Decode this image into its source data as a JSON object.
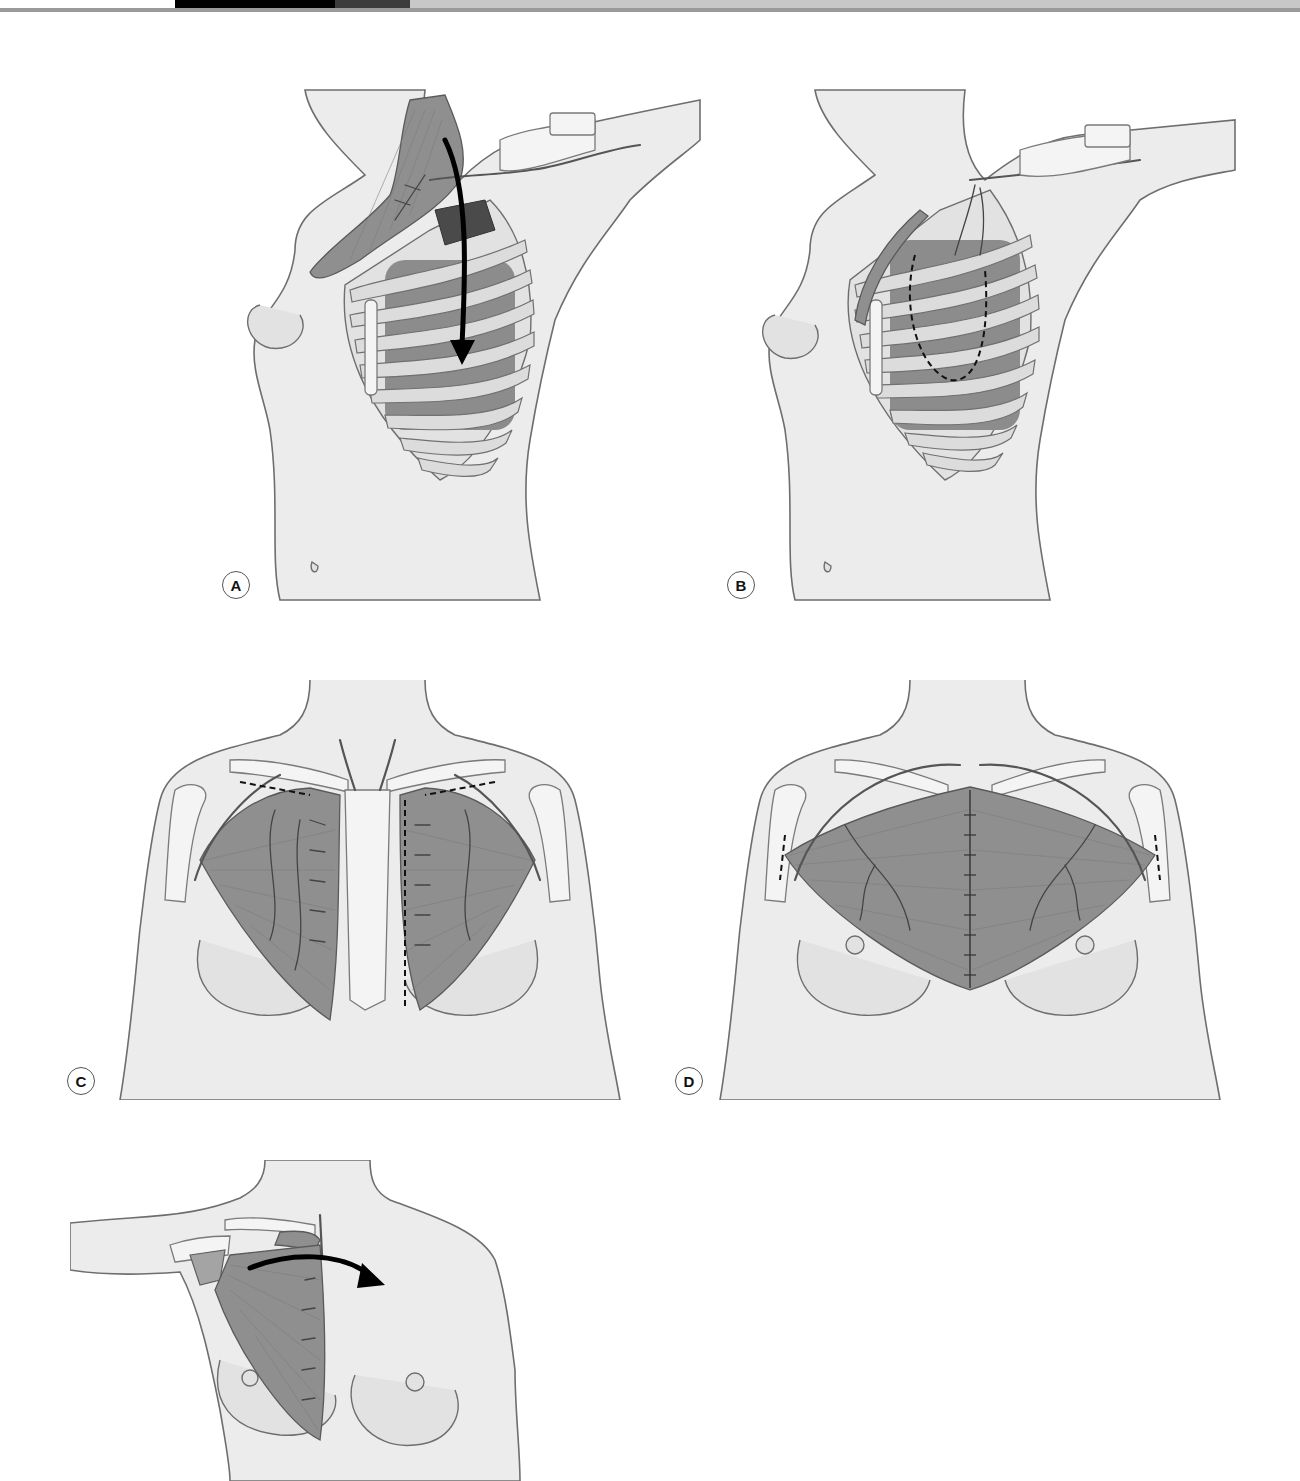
{
  "header": {
    "segments": [
      {
        "name": "white",
        "x": 0,
        "width": 175,
        "color": "#ffffff"
      },
      {
        "name": "black",
        "x": 175,
        "width": 160,
        "color": "#000000"
      },
      {
        "name": "dark-gray",
        "x": 335,
        "width": 75,
        "color": "#3c3c3c"
      },
      {
        "name": "light-gray",
        "x": 410,
        "width": 890,
        "color": "#c8c8c8"
      }
    ],
    "rule_color": "#9a9a9a"
  },
  "figure": {
    "type": "surgical anatomy illustration",
    "color_mode": "grayscale",
    "panels": [
      {
        "id": "A",
        "label": "A",
        "description": "Oblique view, arm abducted; muscle flap reflected upward from chest wall with curved arrow showing transposition into thorax through rib window"
      },
      {
        "id": "B",
        "label": "B",
        "description": "Oblique view; muscle flap positioned within thoracic cavity, dashed outline marking intrathoracic flap placement over ribs"
      },
      {
        "id": "C",
        "label": "C",
        "description": "Frontal view; bilateral pectoralis major muscles elevated off sternum with dashed lines marking clavicular/humeral division and sternal release; perforator vessels shown"
      },
      {
        "id": "D",
        "label": "D",
        "description": "Frontal view; bilateral pectoralis flaps advanced and sutured in midline over sternum; dashed humeral insertion lines"
      },
      {
        "id": "E",
        "label": "",
        "description": "Frontal view, arm abducted; unilateral pectoralis flap with curved arrow showing medial turnover toward midline"
      }
    ]
  },
  "colors": {
    "skin": "#ececec",
    "muscle": "#8f8f8f",
    "outline": "#6e6e6e",
    "arrow": "#000000",
    "label_border": "#555555"
  }
}
